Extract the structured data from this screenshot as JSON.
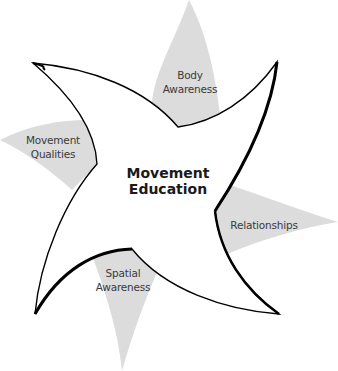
{
  "diagram": {
    "center_label": [
      "Movement",
      "Education"
    ],
    "petals": [
      {
        "id": "body-awareness",
        "lines": [
          "Body",
          "Awareness"
        ]
      },
      {
        "id": "movement-qualities",
        "lines": [
          "Movement",
          "Qualities"
        ]
      },
      {
        "id": "relationships",
        "lines": [
          "Relationships"
        ]
      },
      {
        "id": "spatial-awareness",
        "lines": [
          "Spatial",
          "Awareness"
        ]
      }
    ],
    "colors": {
      "petal_fill": "#dcdcdc",
      "star_fill": "#ffffff",
      "star_stroke": "#000000"
    }
  }
}
